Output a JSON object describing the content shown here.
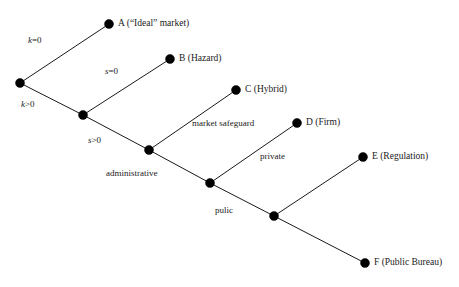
{
  "diagram": {
    "type": "decision-tree",
    "title": "",
    "background_color": "#ffffff",
    "node_color": "#000000",
    "line_color": "#1a1a1a",
    "width": 459,
    "height": 287,
    "nodes": [
      {
        "id": "n0",
        "label": "",
        "x": 20,
        "y": 83,
        "r": 4.5,
        "kind": "internal"
      },
      {
        "id": "n1",
        "label": "",
        "x": 83,
        "y": 115,
        "r": 4.5,
        "kind": "internal"
      },
      {
        "id": "n2",
        "label": "",
        "x": 149,
        "y": 150,
        "r": 4.5,
        "kind": "internal"
      },
      {
        "id": "n3",
        "label": "",
        "x": 210,
        "y": 183,
        "r": 4.5,
        "kind": "internal"
      },
      {
        "id": "n4",
        "label": "",
        "x": 274,
        "y": 216,
        "r": 4.5,
        "kind": "internal"
      },
      {
        "id": "a",
        "label": "A (“Ideal” market)",
        "x": 109,
        "y": 24,
        "r": 4.5,
        "kind": "leaf"
      },
      {
        "id": "b",
        "label": "B (Hazard)",
        "x": 170,
        "y": 59,
        "r": 4.5,
        "kind": "leaf"
      },
      {
        "id": "c",
        "label": "C (Hybrid)",
        "x": 236,
        "y": 90,
        "r": 4.5,
        "kind": "leaf"
      },
      {
        "id": "d",
        "label": "D (Firm)",
        "x": 297,
        "y": 123,
        "r": 4.5,
        "kind": "leaf"
      },
      {
        "id": "e",
        "label": "E (Regulation)",
        "x": 363,
        "y": 157,
        "r": 4.5,
        "kind": "leaf"
      },
      {
        "id": "f",
        "label": "F (Public Bureau)",
        "x": 365,
        "y": 263,
        "r": 4.5,
        "kind": "leaf"
      }
    ],
    "edges": [
      {
        "id": "e-n0-a",
        "from": "n0",
        "to": "a",
        "label": "k=0",
        "label_var": "k",
        "label_rest": "=0",
        "italic_var": true,
        "label_x": 28,
        "label_y": 36
      },
      {
        "id": "e-n0-n1",
        "from": "n0",
        "to": "n1",
        "label": "k>0",
        "label_var": "k",
        "label_rest": ">0",
        "italic_var": true,
        "label_x": 21,
        "label_y": 100
      },
      {
        "id": "e-n1-b",
        "from": "n1",
        "to": "b",
        "label": "s=0",
        "label_var": "s",
        "label_rest": "=0",
        "italic_var": true,
        "label_x": 105,
        "label_y": 67
      },
      {
        "id": "e-n1-n2",
        "from": "n1",
        "to": "n2",
        "label": "s>0",
        "label_var": "s",
        "label_rest": ">0",
        "italic_var": true,
        "label_x": 88,
        "label_y": 136
      },
      {
        "id": "e-n2-c",
        "from": "n2",
        "to": "c",
        "label": "market safeguard",
        "label_var": "",
        "label_rest": "",
        "italic_var": false,
        "label_x": 192,
        "label_y": 119
      },
      {
        "id": "e-n2-n3",
        "from": "n2",
        "to": "n3",
        "label": "administrative",
        "label_var": "",
        "label_rest": "",
        "italic_var": false,
        "label_x": 106,
        "label_y": 169
      },
      {
        "id": "e-n3-d",
        "from": "n3",
        "to": "d",
        "label": "private",
        "label_var": "",
        "label_rest": "",
        "italic_var": false,
        "label_x": 260,
        "label_y": 152
      },
      {
        "id": "e-n3-n4",
        "from": "n3",
        "to": "n4",
        "label": "pulic",
        "label_var": "",
        "label_rest": "",
        "italic_var": false,
        "label_x": 215,
        "label_y": 206
      },
      {
        "id": "e-n4-e",
        "from": "n4",
        "to": "e",
        "label": "",
        "label_var": "",
        "label_rest": "",
        "italic_var": false,
        "label_x": 0,
        "label_y": 0
      },
      {
        "id": "e-n4-f",
        "from": "n4",
        "to": "f",
        "label": "",
        "label_var": "",
        "label_rest": "",
        "italic_var": false,
        "label_x": 0,
        "label_y": 0
      }
    ]
  }
}
